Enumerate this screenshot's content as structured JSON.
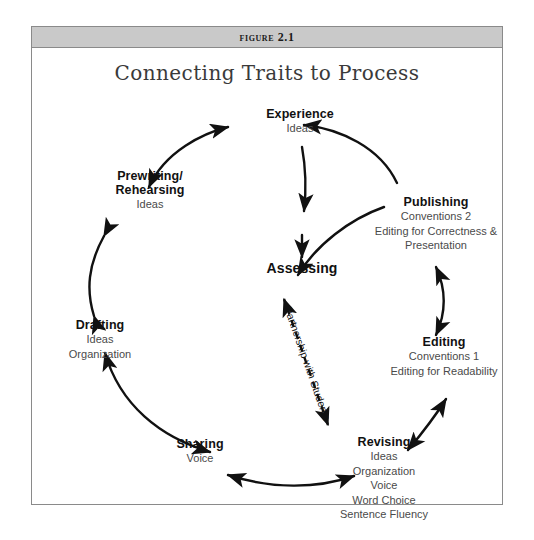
{
  "figure": {
    "header_label": "Figure 2.1",
    "title": "Connecting Traits to Process",
    "border_color": "#8a8a8a",
    "header_bg": "#c9c9c9",
    "ink_color": "#111111",
    "trait_color": "#4a4a4a"
  },
  "center": {
    "label": "Assessing"
  },
  "partnership": {
    "label": "Partnership with Students"
  },
  "nodes": [
    {
      "id": "experience",
      "title": "Experience",
      "traits": [
        "Ideas"
      ]
    },
    {
      "id": "prewriting",
      "title": "Prewriting/\nRehearsing",
      "title_line1": "Prewriting/",
      "title_line2": "Rehearsing",
      "traits": [
        "Ideas"
      ]
    },
    {
      "id": "drafting",
      "title": "Drafting",
      "traits": [
        "Ideas",
        "Organization"
      ]
    },
    {
      "id": "sharing",
      "title": "Sharing",
      "traits": [
        "Voice"
      ]
    },
    {
      "id": "revising",
      "title": "Revising",
      "traits": [
        "Ideas",
        "Organization",
        "Voice",
        "Word Choice",
        "Sentence Fluency"
      ]
    },
    {
      "id": "editing",
      "title": "Editing",
      "traits": [
        "Conventions 1",
        "Editing for Readability"
      ]
    },
    {
      "id": "publishing",
      "title": "Publishing",
      "traits": [
        "Conventions 2",
        "Editing for Correctness &",
        "Presentation"
      ]
    }
  ],
  "node_text": {
    "experience_title": "Experience",
    "experience_traits": "Ideas",
    "prewriting_title_l1": "Prewriting/",
    "prewriting_title_l2": "Rehearsing",
    "prewriting_traits": "Ideas",
    "drafting_title": "Drafting",
    "drafting_traits_l1": "Ideas",
    "drafting_traits_l2": "Organization",
    "sharing_title": "Sharing",
    "sharing_traits": "Voice",
    "revising_title": "Revising",
    "revising_traits_l1": "Ideas",
    "revising_traits_l2": "Organization",
    "revising_traits_l3": "Voice",
    "revising_traits_l4": "Word Choice",
    "revising_traits_l5": "Sentence Fluency",
    "editing_title": "Editing",
    "editing_traits_l1": "Conventions 1",
    "editing_traits_l2": "Editing for Readability",
    "publishing_title": "Publishing",
    "publishing_traits_l1": "Conventions 2",
    "publishing_traits_l2": "Editing for Correctness &",
    "publishing_traits_l3": "Presentation",
    "assessing_title": "Assessing"
  }
}
